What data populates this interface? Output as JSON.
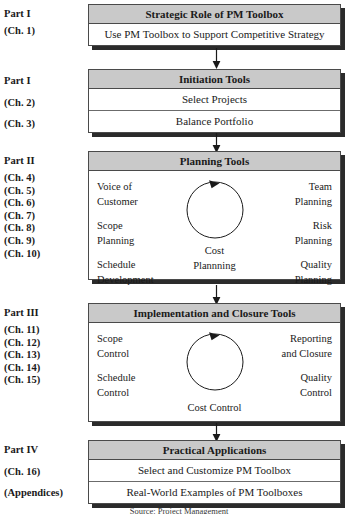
{
  "figure": {
    "caption": "Source: Project Management"
  },
  "colors": {
    "header_fill": "#c9c9c9",
    "box_border": "#4a4a4a",
    "shadow": "#2b2b2b",
    "text": "#1a1a1a",
    "page_background": "#ffffff"
  },
  "sections": [
    {
      "part_label": "Part I",
      "chapters": [
        "(Ch. 1)"
      ],
      "box_title": "Strategic Role of PM Toolbox",
      "rows": [
        "Use PM Toolbox to Support Competitive Strategy"
      ],
      "has_cycle": false
    },
    {
      "part_label": "Part I",
      "chapters": [
        "(Ch. 2)",
        "(Ch. 3)"
      ],
      "box_title": "Initiation Tools",
      "rows": [
        "Select Projects",
        "Balance Portfolio"
      ],
      "has_cycle": false
    },
    {
      "part_label": "Part II",
      "chapters": [
        "(Ch. 4)",
        "(Ch. 5)",
        "(Ch. 6)",
        "(Ch. 7)",
        "(Ch. 8)",
        "(Ch. 9)",
        "(Ch. 10)"
      ],
      "box_title": "Planning Tools",
      "has_cycle": true,
      "cycle": {
        "left": [
          {
            "line1": "Voice of",
            "line2": "Customer"
          },
          {
            "line1": "Scope",
            "line2": "Planning"
          },
          {
            "line1": "Schedule",
            "line2": "Development"
          }
        ],
        "right": [
          {
            "line1": "Team",
            "line2": "Planning"
          },
          {
            "line1": "Risk",
            "line2": "Planning"
          },
          {
            "line1": "Quality",
            "line2": "Planning"
          }
        ],
        "center_line1": "Cost",
        "center_line2": "Plannning"
      }
    },
    {
      "part_label": "Part III",
      "chapters": [
        "(Ch. 11)",
        "(Ch. 12)",
        "(Ch. 13)",
        "(Ch. 14)",
        "(Ch. 15)"
      ],
      "box_title": "Implementation and Closure Tools",
      "has_cycle": true,
      "cycle": {
        "left": [
          {
            "line1": "Scope",
            "line2": "Control"
          },
          {
            "line1": "Schedule",
            "line2": "Control"
          }
        ],
        "right": [
          {
            "line1": "Reporting",
            "line2": "and Closure"
          },
          {
            "line1": "Quality",
            "line2": "Control"
          }
        ],
        "center_line1": "",
        "center_line2": "Cost Control"
      }
    },
    {
      "part_label": "Part IV",
      "chapters": [
        "(Ch. 16)",
        "(Appendices)"
      ],
      "box_title": "Practical Applications",
      "rows": [
        "Select and Customize PM Toolbox",
        "Real-World Examples of PM Toolboxes"
      ],
      "has_cycle": false
    }
  ],
  "icons": {
    "down_arrow": "down-arrow-icon",
    "cycle_arrow": "cycle-arrow-icon"
  }
}
